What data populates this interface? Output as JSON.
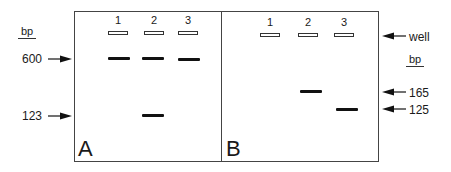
{
  "figure": {
    "panels": [
      {
        "id": "A",
        "letter": "A",
        "lanes": [
          "1",
          "2",
          "3"
        ],
        "bands": [
          {
            "lane": "1",
            "size_bp": 600
          },
          {
            "lane": "2",
            "size_bp": 600
          },
          {
            "lane": "3",
            "size_bp": 600
          },
          {
            "lane": "2",
            "size_bp": 123
          }
        ],
        "markers": {
          "unit": "bp",
          "labels": [
            "600",
            "123"
          ]
        }
      },
      {
        "id": "B",
        "letter": "B",
        "lanes": [
          "1",
          "2",
          "3"
        ],
        "bands": [
          {
            "lane": "2",
            "size_bp": 165
          },
          {
            "lane": "3",
            "size_bp": 125
          }
        ],
        "markers": {
          "unit": "bp",
          "well_label": "well",
          "labels": [
            "165",
            "125"
          ]
        }
      }
    ]
  },
  "left_axis": {
    "unit": "bp",
    "m600": "600",
    "m123": "123"
  },
  "right_axis": {
    "well": "well",
    "unit": "bp",
    "m165": "165",
    "m125": "125"
  },
  "colors": {
    "band": "#111111",
    "border": "#444444",
    "background": "#ffffff"
  }
}
